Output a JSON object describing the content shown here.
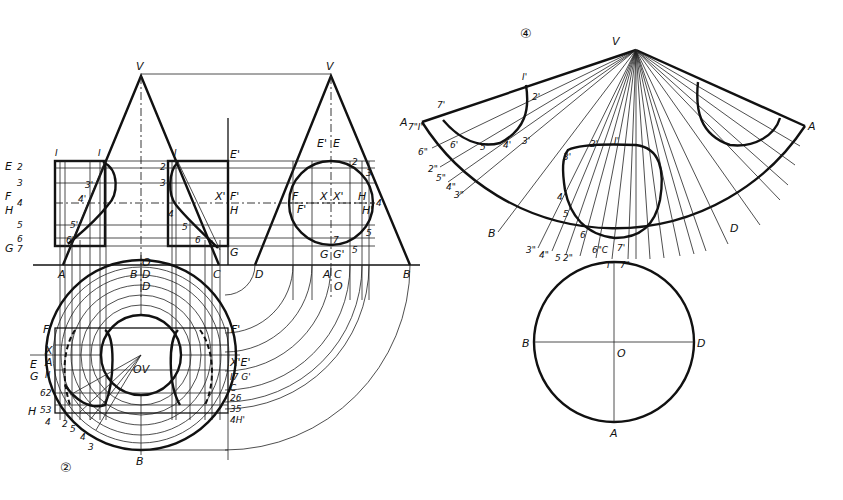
{
  "figure": {
    "type": "descriptive-geometry drawing: intersection of two cones and surface development",
    "view_numbers": [
      "②",
      "④"
    ],
    "left_view": {
      "apex_labels": [
        "V",
        "V"
      ],
      "elevation_labels_left": [
        "I",
        "E",
        "2",
        "3",
        "F",
        "H",
        "4",
        "5",
        "6",
        "G",
        "7"
      ],
      "curve_labels_left": [
        "1",
        "2'",
        "3'",
        "4'",
        "5'",
        "6'",
        "7'"
      ],
      "middle_labels": [
        "I",
        "2",
        "3",
        "4",
        "5",
        "6",
        "7",
        "E'",
        "X'",
        "F'",
        "H",
        "G"
      ],
      "circle_labels": [
        "E'",
        "E",
        "2",
        "3",
        "F",
        "F'",
        "X",
        "X'",
        "H",
        "H'",
        "4",
        "5",
        "7",
        "G",
        "G'",
        "5"
      ],
      "baseline_labels": [
        "A",
        "B",
        "D",
        "C",
        "D",
        "A",
        "C",
        "B"
      ],
      "center_labels": [
        "O",
        "O"
      ],
      "plan_labels_left": [
        "F",
        "X",
        "A",
        "E",
        "G",
        "II",
        "62",
        "H",
        "53",
        "4"
      ],
      "plan_labels_right": [
        "F'",
        "X'E'",
        "I7 G'",
        "C",
        "26",
        "35",
        "4H'"
      ],
      "plan_center": "OV",
      "plan_bottom": "B",
      "plan_top": "D",
      "plan_bottom_numbers": [
        "2",
        "5",
        "4",
        "3"
      ]
    },
    "right_view": {
      "apex": "V",
      "development_labels": [
        "A",
        "7\"I\"",
        "7'",
        "I'",
        "2'",
        "3'",
        "4'",
        "5'",
        "6'",
        "6\"",
        "2\"",
        "5\"",
        "4\"",
        "3\"",
        "B",
        "D",
        "A"
      ],
      "inner_curve_labels": [
        "3'",
        "2'",
        "I'",
        "4",
        "5",
        "6",
        "6\"C",
        "7'"
      ],
      "bottom_arc_labels": [
        "3\"",
        "4\"",
        "5",
        "2\"",
        "I\"",
        "7\""
      ],
      "base_circle_labels": [
        "B",
        "O",
        "D",
        "A"
      ]
    }
  },
  "colors": {
    "ink": "#111111",
    "paper": "#ffffff"
  }
}
